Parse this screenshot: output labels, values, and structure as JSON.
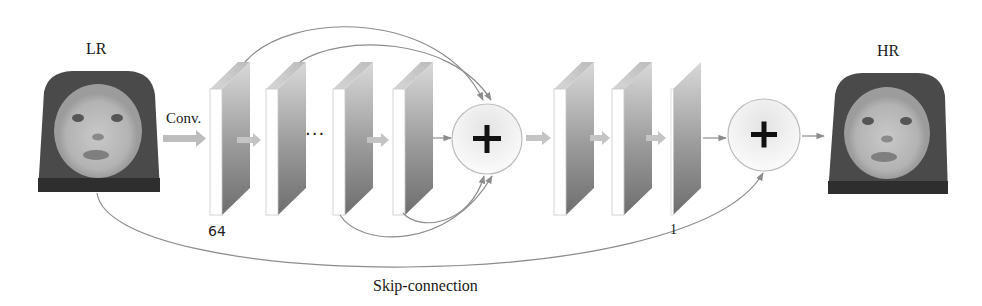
{
  "diagram": {
    "input_label": "LR",
    "output_label": "HR",
    "conv_label": "Conv.",
    "first_channels_label": "64",
    "last_channels_label": "1",
    "ellipsis": "...",
    "skip_label": "Skip-connection",
    "add_symbol": "+",
    "colors": {
      "stroke": "#8c8c8c",
      "arrow_fill": "#bdbdbd",
      "block_front": "#ffffff",
      "block_side_top": "#cfcfcf",
      "block_side_bottom": "#7a7a7a",
      "circle_fill": "#f2f2f2",
      "plus": "#111111",
      "text": "#1a1a1a"
    },
    "nodes": [
      {
        "id": "lr-image",
        "type": "image",
        "label": "LR"
      },
      {
        "id": "conv-block-1",
        "type": "feature-map"
      },
      {
        "id": "conv-block-2",
        "type": "feature-map"
      },
      {
        "id": "conv-block-3",
        "type": "feature-map"
      },
      {
        "id": "conv-block-4",
        "type": "feature-map"
      },
      {
        "id": "add-1",
        "type": "sum"
      },
      {
        "id": "conv-block-5",
        "type": "feature-map"
      },
      {
        "id": "conv-block-6",
        "type": "feature-map"
      },
      {
        "id": "conv-block-7",
        "type": "feature-map"
      },
      {
        "id": "add-2",
        "type": "sum"
      },
      {
        "id": "hr-image",
        "type": "image",
        "label": "HR"
      }
    ],
    "edges": [
      {
        "from": "lr-image",
        "to": "conv-block-1",
        "label": "Conv."
      },
      {
        "from": "conv-block-1",
        "to": "conv-block-2"
      },
      {
        "from": "conv-block-3",
        "to": "conv-block-4"
      },
      {
        "from": "conv-block-4",
        "to": "add-1"
      },
      {
        "from": "conv-block-1",
        "to": "add-1",
        "kind": "dense-skip"
      },
      {
        "from": "conv-block-2",
        "to": "add-1",
        "kind": "dense-skip"
      },
      {
        "from": "conv-block-3",
        "to": "add-1",
        "kind": "dense-skip"
      },
      {
        "from": "conv-block-4",
        "to": "add-1",
        "kind": "dense-skip"
      },
      {
        "from": "add-1",
        "to": "conv-block-5"
      },
      {
        "from": "conv-block-5",
        "to": "conv-block-6"
      },
      {
        "from": "conv-block-6",
        "to": "conv-block-7"
      },
      {
        "from": "conv-block-7",
        "to": "add-2"
      },
      {
        "from": "lr-image",
        "to": "add-2",
        "label": "Skip-connection"
      },
      {
        "from": "add-2",
        "to": "hr-image"
      }
    ]
  }
}
